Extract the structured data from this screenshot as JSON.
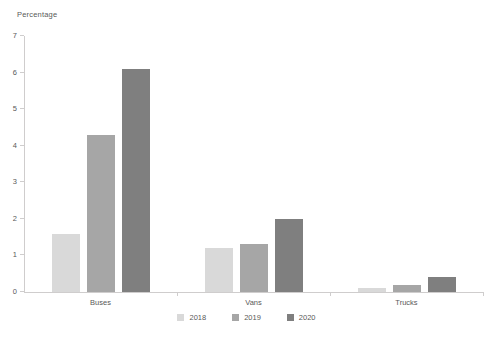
{
  "window": {
    "background": "#ffffff"
  },
  "chart_data": {
    "type": "bar",
    "title": "",
    "ylabel": "Percentage",
    "xlabel": "",
    "categories": [
      "Buses",
      "Vans",
      "Trucks"
    ],
    "series": [
      {
        "name": "2018",
        "color": "#d9d9d9",
        "values": [
          1.6,
          1.2,
          0.1
        ]
      },
      {
        "name": "2019",
        "color": "#a6a6a6",
        "values": [
          4.3,
          1.3,
          0.2
        ]
      },
      {
        "name": "2020",
        "color": "#7f7f7f",
        "values": [
          6.1,
          2.0,
          0.4
        ]
      }
    ],
    "ylim": [
      0,
      7
    ],
    "yticks": [
      0,
      1,
      2,
      3,
      4,
      5,
      6,
      7
    ],
    "grid": false,
    "legend_position": "bottom",
    "colors": {
      "axis": "#cfcdcd",
      "text": "#595959"
    }
  }
}
